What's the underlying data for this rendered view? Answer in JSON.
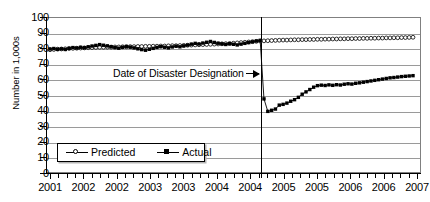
{
  "chart_data": {
    "type": "line",
    "title": "",
    "xlabel": "",
    "ylabel": "Number in 1,000s",
    "ylim": [
      0,
      100
    ],
    "yticks": [
      0,
      10,
      20,
      30,
      40,
      50,
      60,
      70,
      80,
      90,
      100
    ],
    "grid": true,
    "legend_position": "lower-left-inside",
    "x_tick_labels": [
      "2001",
      "2002",
      "2002",
      "2003",
      "2003",
      "2004",
      "2004",
      "2005",
      "2005",
      "2006",
      "2006",
      "2007"
    ],
    "x_minor_ticks_per_label": 3,
    "annotations": [
      {
        "text": "Date of Disaster Designation",
        "points_to": "vertical-event-line",
        "arrow": "right"
      }
    ],
    "event_line": {
      "label": "Date of Disaster Designation",
      "x_index": 55
    },
    "x": [
      0,
      1,
      2,
      3,
      4,
      5,
      6,
      7,
      8,
      9,
      10,
      11,
      12,
      13,
      14,
      15,
      16,
      17,
      18,
      19,
      20,
      21,
      22,
      23,
      24,
      25,
      26,
      27,
      28,
      29,
      30,
      31,
      32,
      33,
      34,
      35,
      36,
      37,
      38,
      39,
      40,
      41,
      42,
      43,
      44,
      45,
      46,
      47,
      48,
      49,
      50,
      51,
      52,
      53,
      54,
      55,
      56,
      57,
      58,
      59,
      60,
      61,
      62,
      63,
      64,
      65,
      66,
      67,
      68,
      69,
      70,
      71,
      72,
      73,
      74,
      75,
      76,
      77,
      78,
      79,
      80,
      81,
      82,
      83,
      84,
      85,
      86,
      87,
      88,
      89,
      90,
      91,
      92,
      93,
      94,
      95
    ],
    "series": [
      {
        "name": "Predicted",
        "marker": "open-circle",
        "values": [
          79.0,
          79.2,
          79.4,
          79.5,
          79.6,
          79.8,
          79.9,
          80.0,
          80.1,
          80.2,
          80.3,
          80.4,
          80.5,
          80.6,
          80.6,
          80.7,
          80.7,
          80.8,
          80.8,
          80.9,
          80.9,
          81.0,
          81.0,
          81.1,
          81.1,
          81.2,
          81.2,
          81.3,
          81.3,
          81.4,
          81.4,
          81.5,
          81.6,
          81.6,
          81.7,
          81.8,
          81.9,
          82.0,
          82.1,
          82.2,
          82.3,
          82.4,
          82.5,
          82.6,
          82.7,
          82.8,
          82.9,
          83.0,
          83.2,
          83.4,
          83.6,
          83.8,
          84.0,
          84.2,
          84.4,
          84.6,
          84.7,
          84.8,
          84.9,
          85.0,
          85.1,
          85.2,
          85.2,
          85.3,
          85.4,
          85.4,
          85.5,
          85.5,
          85.6,
          85.6,
          85.7,
          85.7,
          85.8,
          85.8,
          85.9,
          85.9,
          86.0,
          86.0,
          86.1,
          86.1,
          86.2,
          86.2,
          86.3,
          86.3,
          86.4,
          86.4,
          86.5,
          86.5,
          86.6,
          86.6,
          86.7,
          86.7,
          86.8,
          86.8,
          86.9,
          87.0
        ]
      },
      {
        "name": "Actual",
        "marker": "filled-square",
        "values": [
          79.5,
          79.8,
          79.3,
          79.6,
          79.2,
          79.9,
          80.4,
          80.1,
          80.6,
          80.3,
          80.9,
          81.4,
          81.8,
          82.3,
          81.9,
          81.5,
          81.0,
          80.4,
          80.0,
          80.6,
          81.1,
          80.7,
          80.2,
          79.6,
          79.1,
          78.7,
          79.3,
          79.9,
          80.5,
          81.0,
          80.6,
          80.2,
          80.8,
          81.3,
          80.9,
          81.5,
          82.0,
          82.6,
          83.1,
          82.7,
          83.3,
          83.8,
          84.3,
          83.7,
          83.2,
          82.8,
          82.4,
          82.9,
          82.5,
          82.1,
          82.6,
          83.1,
          83.6,
          84.1,
          84.6,
          85.0,
          47.5,
          39.5,
          40.2,
          41.0,
          43.5,
          44.0,
          44.8,
          46.0,
          47.0,
          48.5,
          50.5,
          52.0,
          53.5,
          55.0,
          56.0,
          56.3,
          56.1,
          56.5,
          56.2,
          56.6,
          56.4,
          56.9,
          57.2,
          57.0,
          57.5,
          57.8,
          58.2,
          58.6,
          59.0,
          59.4,
          59.8,
          60.2,
          60.6,
          61.0,
          61.2,
          61.5,
          61.8,
          62.0,
          62.2,
          62.4
        ]
      }
    ]
  },
  "legend": {
    "entries": [
      {
        "label": "Predicted",
        "marker": "open-circle"
      },
      {
        "label": "Actual",
        "marker": "filled-square"
      }
    ]
  },
  "axis": {
    "y_title": "Number in 1,000s"
  }
}
